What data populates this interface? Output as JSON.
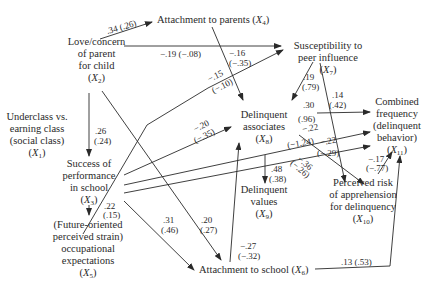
{
  "nodes": {
    "x1": {
      "label_lines": [
        "Underclass vs.",
        "earning class",
        "(social class)"
      ],
      "var": "X",
      "sub": "1"
    },
    "x2": {
      "label_lines": [
        "Love/concern",
        "of parent",
        "for child"
      ],
      "var": "X",
      "sub": "2"
    },
    "x3": {
      "label_lines": [
        "Success of",
        "performance",
        "in school"
      ],
      "var": "X",
      "sub": "3"
    },
    "x4": {
      "label_lines": [
        "Attachment to parents"
      ],
      "var": "X",
      "sub": "4"
    },
    "x5": {
      "label_lines": [
        "(Future-oriented",
        "perceived strain)",
        "occupational",
        "expectations"
      ],
      "var": "X",
      "sub": "5"
    },
    "x6": {
      "label_lines": [
        "Attachment to school"
      ],
      "var": "X",
      "sub": "6"
    },
    "x7": {
      "label_lines": [
        "Susceptibility to",
        "peer influence"
      ],
      "var": "X",
      "sub": "7"
    },
    "x8": {
      "label_lines": [
        "Delinquent",
        "associates"
      ],
      "var": "X",
      "sub": "8"
    },
    "x9": {
      "label_lines": [
        "Delinquent",
        "values"
      ],
      "var": "X",
      "sub": "9"
    },
    "x10": {
      "label_lines": [
        "Perceived risk",
        "of apprehension",
        "for delinquency"
      ],
      "var": "X",
      "sub": "10"
    },
    "x11": {
      "label_lines": [
        "Combined",
        "frequency",
        "(delinquent",
        "behavior)"
      ],
      "var": "X",
      "sub": "11"
    }
  },
  "paths": [
    {
      "from": "x2",
      "to": "x4",
      "coef": ".34",
      "std": "(.26)"
    },
    {
      "from": "x2",
      "to": "x7",
      "coef": "−.19",
      "std": "(−.08)"
    },
    {
      "from": "x4",
      "to": "x8",
      "coef": "−.16",
      "std": "(−.35)"
    },
    {
      "from": "x5",
      "to": "x7",
      "coef": "−.15",
      "std": "(−.10)"
    },
    {
      "from": "x7",
      "to": "x8",
      "coef": ".19",
      "std": "(.79)"
    },
    {
      "from": "x7",
      "to": "x10",
      "coef": ".14",
      "std": "(.42)"
    },
    {
      "from": "x2",
      "to": "x3",
      "coef": ".26",
      "std": "(.24)"
    },
    {
      "from": "x3",
      "to": "x8",
      "coef": "−.20",
      "std": "(−.35)"
    },
    {
      "from": "x8",
      "to": "x11",
      "coef": ".30",
      "std": "(.96)"
    },
    {
      "from": "x3",
      "to": "x11",
      "coef": "−.22",
      "std": "(−1.24)"
    },
    {
      "from": "x3",
      "to": "x11b",
      "coef": "−.22",
      "std": "(−.29)"
    },
    {
      "from": "x8",
      "to": "x10",
      "coef": "−.36",
      "std": "(−.26)"
    },
    {
      "from": "x10",
      "to": "x11",
      "coef": "−.17",
      "std": "(−.77)"
    },
    {
      "from": "x8",
      "to": "x9",
      "coef": ".48",
      "std": "(.38)"
    },
    {
      "from": "x3",
      "to": "x5",
      "coef": ".22",
      "std": "(.15)"
    },
    {
      "from": "x3",
      "to": "x6",
      "coef": ".31",
      "std": "(.46)"
    },
    {
      "from": "x2",
      "to": "x6",
      "coef": ".20",
      "std": "(.27)"
    },
    {
      "from": "x6",
      "to": "x8",
      "coef": "−.27",
      "std": "(−.32)"
    },
    {
      "from": "x6",
      "to": "x11",
      "coef": ".13",
      "std": "(.53)"
    }
  ],
  "labels": {
    "p_2_4": ".34 (.26)",
    "p_2_7": "−.19 (−.08)",
    "p_4_8_a": "−.16",
    "p_4_8_b": "(−.35)",
    "p_5_7_a": "−.15",
    "p_5_7_b": "(−.10)",
    "p_7_8_a": ".19",
    "p_7_8_b": "(.79)",
    "p_7_10_a": ".14",
    "p_7_10_b": "(.42)",
    "p_2_3_a": ".26",
    "p_2_3_b": "(.24)",
    "p_3_8_a": "−.20",
    "p_3_8_b": "(−.35)",
    "p_8_11_a": ".30",
    "p_8_11_b": "(.96)",
    "p_3_11a_a": "−.22",
    "p_3_11a_b": "(−1.24)",
    "p_3_11b_a": "−.22",
    "p_3_11b_b": "(−.29)",
    "p_8_10_a": "−.36",
    "p_8_10_b": "(−.26)",
    "p_10_11_a": "−.17",
    "p_10_11_b": "(−.77)",
    "p_8_9_a": ".48",
    "p_8_9_b": "(.38)",
    "p_3_5_a": ".22",
    "p_3_5_b": "(.15)",
    "p_3_6_a": ".31",
    "p_3_6_b": "(.46)",
    "p_2_6_a": ".20",
    "p_2_6_b": "(.27)",
    "p_6_8_a": "−.27",
    "p_6_8_b": "(−.32)",
    "p_6_11": ".13 (.53)"
  },
  "colors": {
    "ink": "#2a2a2a",
    "background": "#ffffff"
  }
}
